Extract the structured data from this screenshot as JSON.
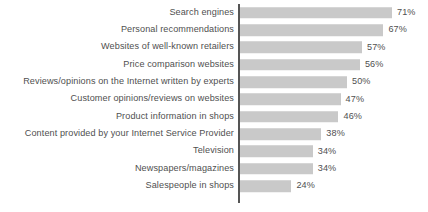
{
  "chart_data": {
    "type": "bar",
    "orientation": "horizontal",
    "title": "",
    "subtitle": "",
    "xlabel": "",
    "ylabel": "",
    "xlim": [
      0,
      75
    ],
    "grid": false,
    "legend": false,
    "value_suffix": "%",
    "bar_color": "#c9c9c9",
    "axis_color": "#555555",
    "text_color": "#4f4f4f",
    "categories": [
      "Search engines",
      "Personal recommendations",
      "Websites of well-known retailers",
      "Price comparison websites",
      "Reviews/opinions on the Internet written by experts",
      "Customer opinions/reviews on websites",
      "Product information in shops",
      "Content provided by your Internet Service Provider",
      "Television",
      "Newspapers/magazines",
      "Salespeople in shops"
    ],
    "values": [
      71,
      67,
      57,
      56,
      50,
      47,
      46,
      38,
      34,
      34,
      24
    ],
    "value_labels": [
      "71%",
      "67%",
      "57%",
      "56%",
      "50%",
      "47%",
      "46%",
      "38%",
      "34%",
      "34%",
      "24%"
    ]
  }
}
